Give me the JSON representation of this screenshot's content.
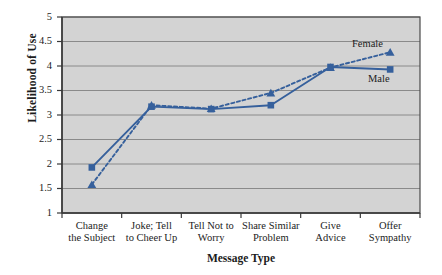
{
  "chart_data": {
    "type": "line",
    "title": "",
    "xlabel": "Message Type",
    "ylabel": "Likelihood of Use",
    "categories": [
      "Change the Subject",
      "Joke; Tell to Cheer Up",
      "Tell Not to Worry",
      "Share Similar Problem",
      "Give Advice",
      "Offer Sympathy"
    ],
    "category_lines": [
      [
        "Change",
        "the Subject"
      ],
      [
        "Joke; Tell",
        "to Cheer Up"
      ],
      [
        "Tell Not to",
        "Worry"
      ],
      [
        "Share Similar",
        "Problem"
      ],
      [
        "Give",
        "Advice"
      ],
      [
        "Offer",
        "Sympathy"
      ]
    ],
    "series": [
      {
        "name": "Male",
        "marker": "square",
        "line_style": "solid",
        "color": "#36609c",
        "values": [
          1.93,
          3.17,
          3.12,
          3.2,
          3.98,
          3.93
        ]
      },
      {
        "name": "Female",
        "marker": "triangle",
        "line_style": "dashed",
        "color": "#36609c",
        "values": [
          1.58,
          3.2,
          3.13,
          3.45,
          3.97,
          4.28
        ]
      }
    ],
    "ylim": [
      1,
      5
    ],
    "ytick_values": [
      1,
      1.5,
      2,
      2.5,
      3,
      3.5,
      4,
      4.5,
      5
    ],
    "ytick_labels": [
      "1",
      "1.5",
      "2",
      "2.5",
      "3",
      "3.5",
      "4",
      "4.5",
      "5"
    ],
    "grid": "horizontal",
    "legend_position": "inline-annotations",
    "annotations": [
      {
        "text": "Female",
        "series": "Female"
      },
      {
        "text": "Male",
        "series": "Male"
      }
    ],
    "plot_background": "#d3d3d3",
    "gridline_color": "#8a8a8a",
    "axis_color": "#555555"
  }
}
